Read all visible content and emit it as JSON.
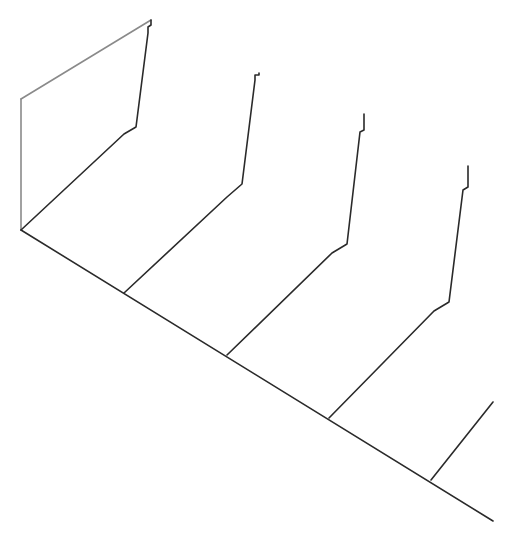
{
  "diagram": {
    "type": "3d-waterfall-line-drawing",
    "background": "#ffffff",
    "colors": {
      "dark": "#2a2a2a",
      "gray": "#8a8a8a"
    },
    "baseline": {
      "points": [
        [
          21,
          230
        ],
        [
          493,
          521
        ]
      ]
    },
    "back_frame": {
      "vertical": [
        [
          21,
          230
        ],
        [
          21,
          99
        ]
      ],
      "top_edge": [
        [
          21,
          99
        ],
        [
          151,
          20
        ]
      ]
    },
    "slices": [
      {
        "name": "slice-1",
        "points": [
          [
            21,
            230
          ],
          [
            124,
            134
          ],
          [
            136,
            127
          ],
          [
            148,
            33
          ],
          [
            148,
            27
          ],
          [
            151,
            25
          ],
          [
            151,
            20
          ]
        ]
      },
      {
        "name": "slice-2",
        "points": [
          [
            124,
            293
          ],
          [
            227,
            197
          ],
          [
            242,
            184
          ],
          [
            255,
            80
          ],
          [
            255,
            75
          ],
          [
            259,
            75
          ],
          [
            259,
            73
          ]
        ]
      },
      {
        "name": "slice-3",
        "points": [
          [
            227,
            355
          ],
          [
            332,
            253
          ],
          [
            347,
            244
          ],
          [
            360,
            132
          ],
          [
            364,
            130
          ],
          [
            364,
            114
          ]
        ]
      },
      {
        "name": "slice-4",
        "points": [
          [
            329,
            418
          ],
          [
            434,
            311
          ],
          [
            449,
            302
          ],
          [
            463,
            190
          ],
          [
            468,
            187
          ],
          [
            468,
            166
          ]
        ]
      },
      {
        "name": "slice-5",
        "points": [
          [
            431,
            480
          ],
          [
            493,
            402
          ]
        ]
      }
    ]
  }
}
